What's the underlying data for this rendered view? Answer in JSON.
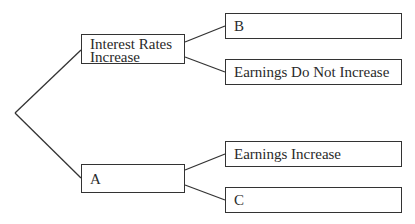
{
  "diagram": {
    "type": "decision-tree",
    "root": {
      "label": ""
    },
    "branches": [
      {
        "id": "interest_rates_increase",
        "label_lines": [
          "Interest Rates",
          "Increase"
        ],
        "children": [
          {
            "id": "b",
            "label": "B"
          },
          {
            "id": "earnings_do_not_increase",
            "label": "Earnings Do Not Increase"
          }
        ]
      },
      {
        "id": "a",
        "label_lines": [
          "A"
        ],
        "children": [
          {
            "id": "earnings_increase",
            "label": "Earnings Increase"
          },
          {
            "id": "c",
            "label": "C"
          }
        ]
      }
    ],
    "colors": {
      "line": "#333333",
      "box_border": "#333333",
      "text": "#2a2a2a",
      "background": "#ffffff"
    }
  }
}
